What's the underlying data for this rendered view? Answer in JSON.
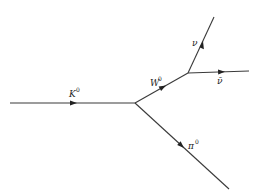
{
  "diagram": {
    "type": "feynman",
    "background": "#ffffff",
    "line_color": "#3a3a3a",
    "vertices": [
      {
        "id": "v1",
        "x": 135,
        "y": 103
      },
      {
        "id": "v2",
        "x": 188,
        "y": 73
      }
    ],
    "particles": [
      {
        "id": "kaon",
        "label": "K",
        "sup": "0",
        "from": [
          10,
          103
        ],
        "to": [
          135,
          103
        ]
      },
      {
        "id": "w-boson",
        "label": "W",
        "sup": "0",
        "from": [
          135,
          103
        ],
        "to": [
          188,
          73
        ]
      },
      {
        "id": "neutrino",
        "label": "ν",
        "sup": "",
        "from": [
          188,
          73
        ],
        "to": [
          214,
          17
        ]
      },
      {
        "id": "antineutrino",
        "label": "ν̄",
        "sup": "",
        "from": [
          188,
          73
        ],
        "to": [
          249,
          71
        ]
      },
      {
        "id": "pion",
        "label": "π",
        "sup": "0",
        "from": [
          135,
          103
        ],
        "to": [
          229,
          189
        ]
      }
    ]
  }
}
